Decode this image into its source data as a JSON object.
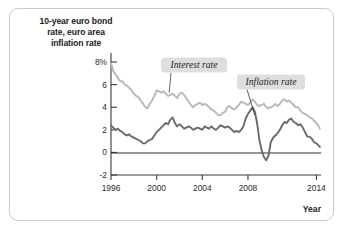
{
  "figure": {
    "title": {
      "line1": "10-year euro bond",
      "line2": "rate, euro area",
      "line3": "inflation rate"
    },
    "colors": {
      "interest_rate_line": "#b8b8b8",
      "inflation_rate_line": "#6a6a6a",
      "axis": "#3a3a3a",
      "zero_line": "#2b2b2b",
      "annotation_background": "#dedede",
      "card_border": "#c9c9c9"
    }
  },
  "chart_data": {
    "type": "line",
    "title": "10-year euro bond rate, euro area inflation rate",
    "xlabel": "Year",
    "ylabel": "",
    "grid": false,
    "legend_position": "inline-annotations",
    "xlim": [
      1996,
      2014.4
    ],
    "ylim": [
      -2,
      8.8
    ],
    "xticks": [
      "1996",
      "2000",
      "2004",
      "2008",
      "2014"
    ],
    "xtick_values": [
      1996,
      2000,
      2004,
      2008,
      2014
    ],
    "yticks": [
      "8%",
      "6",
      "4",
      "2",
      "0",
      "-2"
    ],
    "ytick_values": [
      8,
      6,
      4,
      2,
      0,
      -2
    ],
    "annotations": [
      {
        "id": "interest-rate-annotation",
        "label": "Interest rate",
        "points_to_year": 2001.1,
        "points_to_value": 5.3
      },
      {
        "id": "inflation-rate-annotation",
        "label": "Inflation rate",
        "points_to_year": 2008.6,
        "points_to_value": 3.3
      }
    ],
    "series": [
      {
        "name": "Interest rate",
        "color": "#b8b8b8",
        "x": [
          1996.0,
          1996.2,
          1996.4,
          1996.6,
          1996.8,
          1997.0,
          1997.2,
          1997.4,
          1997.6,
          1997.8,
          1998.0,
          1998.2,
          1998.4,
          1998.6,
          1998.8,
          1999.0,
          1999.2,
          1999.4,
          1999.6,
          1999.8,
          2000.0,
          2000.2,
          2000.4,
          2000.6,
          2000.8,
          2001.0,
          2001.2,
          2001.4,
          2001.6,
          2001.8,
          2002.0,
          2002.2,
          2002.4,
          2002.6,
          2002.8,
          2003.0,
          2003.2,
          2003.4,
          2003.6,
          2003.8,
          2004.0,
          2004.2,
          2004.4,
          2004.6,
          2004.8,
          2005.0,
          2005.2,
          2005.4,
          2005.6,
          2005.8,
          2006.0,
          2006.2,
          2006.4,
          2006.6,
          2006.8,
          2007.0,
          2007.2,
          2007.4,
          2007.6,
          2007.8,
          2008.0,
          2008.2,
          2008.4,
          2008.6,
          2008.8,
          2009.0,
          2009.2,
          2009.4,
          2009.6,
          2009.8,
          2010.0,
          2010.2,
          2010.4,
          2010.6,
          2010.8,
          2011.0,
          2011.2,
          2011.4,
          2011.6,
          2011.8,
          2012.0,
          2012.2,
          2012.4,
          2012.6,
          2012.8,
          2013.0,
          2013.2,
          2013.4,
          2013.6,
          2013.8,
          2014.0,
          2014.2,
          2014.3
        ],
        "values": [
          7.9,
          7.2,
          6.9,
          6.6,
          6.3,
          6.3,
          6.0,
          5.9,
          5.7,
          5.5,
          5.2,
          5.0,
          4.9,
          4.6,
          4.3,
          4.0,
          3.9,
          4.3,
          4.6,
          5.0,
          5.5,
          5.4,
          5.3,
          5.4,
          5.2,
          5.0,
          5.1,
          5.2,
          5.0,
          4.8,
          5.2,
          5.3,
          5.1,
          4.8,
          4.5,
          4.2,
          4.0,
          4.2,
          4.3,
          4.4,
          4.2,
          4.3,
          4.2,
          4.0,
          3.8,
          3.7,
          3.5,
          3.3,
          3.3,
          3.5,
          3.6,
          4.0,
          4.1,
          3.9,
          3.8,
          4.0,
          4.2,
          4.5,
          4.4,
          4.3,
          4.2,
          4.4,
          4.7,
          4.5,
          4.2,
          4.1,
          4.2,
          4.3,
          4.0,
          3.9,
          4.0,
          4.1,
          4.3,
          4.1,
          4.3,
          4.6,
          4.7,
          4.5,
          4.6,
          4.4,
          4.2,
          4.0,
          4.0,
          3.7,
          3.5,
          3.4,
          3.3,
          3.1,
          3.0,
          2.8,
          2.6,
          2.3,
          2.1
        ]
      },
      {
        "name": "Inflation rate",
        "color": "#6a6a6a",
        "x": [
          1996.0,
          1996.2,
          1996.4,
          1996.6,
          1996.8,
          1997.0,
          1997.2,
          1997.4,
          1997.6,
          1997.8,
          1998.0,
          1998.2,
          1998.4,
          1998.6,
          1998.8,
          1999.0,
          1999.2,
          1999.4,
          1999.6,
          1999.8,
          2000.0,
          2000.2,
          2000.4,
          2000.6,
          2000.8,
          2001.0,
          2001.2,
          2001.4,
          2001.6,
          2001.8,
          2002.0,
          2002.2,
          2002.4,
          2002.6,
          2002.8,
          2003.0,
          2003.2,
          2003.4,
          2003.6,
          2003.8,
          2004.0,
          2004.2,
          2004.4,
          2004.6,
          2004.8,
          2005.0,
          2005.2,
          2005.4,
          2005.6,
          2005.8,
          2006.0,
          2006.2,
          2006.4,
          2006.6,
          2006.8,
          2007.0,
          2007.2,
          2007.4,
          2007.6,
          2007.8,
          2008.0,
          2008.2,
          2008.4,
          2008.6,
          2008.8,
          2009.0,
          2009.2,
          2009.4,
          2009.6,
          2009.8,
          2010.0,
          2010.2,
          2010.4,
          2010.6,
          2010.8,
          2011.0,
          2011.2,
          2011.4,
          2011.6,
          2011.8,
          2012.0,
          2012.2,
          2012.4,
          2012.6,
          2012.8,
          2013.0,
          2013.2,
          2013.4,
          2013.6,
          2013.8,
          2014.0,
          2014.2,
          2014.3
        ],
        "values": [
          2.4,
          2.2,
          2.0,
          2.1,
          1.9,
          1.8,
          1.6,
          1.5,
          1.6,
          1.4,
          1.3,
          1.2,
          1.1,
          1.0,
          0.8,
          0.8,
          1.0,
          1.1,
          1.2,
          1.5,
          1.8,
          2.0,
          2.2,
          2.4,
          2.6,
          2.5,
          2.9,
          3.1,
          2.6,
          2.3,
          2.5,
          2.3,
          2.1,
          2.2,
          2.3,
          2.2,
          2.0,
          2.1,
          2.2,
          2.1,
          2.0,
          2.3,
          2.2,
          2.1,
          2.3,
          2.1,
          2.0,
          2.2,
          2.4,
          2.3,
          2.2,
          2.3,
          2.2,
          2.0,
          1.8,
          1.9,
          1.8,
          2.0,
          2.3,
          3.0,
          3.4,
          3.7,
          4.0,
          3.6,
          2.6,
          1.1,
          0.2,
          -0.4,
          -0.7,
          -0.3,
          0.9,
          1.3,
          1.5,
          1.7,
          2.0,
          2.4,
          2.7,
          2.6,
          2.9,
          3.0,
          2.7,
          2.6,
          2.4,
          2.5,
          2.2,
          1.8,
          1.4,
          1.4,
          1.2,
          0.9,
          0.8,
          0.6,
          0.5
        ]
      }
    ]
  },
  "axis_labels": {
    "x_axis_name": "Year"
  }
}
